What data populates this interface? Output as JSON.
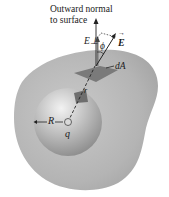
{
  "diagram": {
    "title_line1": "Outward normal",
    "title_line2": "to surface",
    "labels": {
      "e_perp": "E⊥",
      "phi": "ϕ",
      "e_vector": "E",
      "e_vector_arrow": "→",
      "dA": "dA",
      "r": "r",
      "R": "R",
      "q": "q"
    },
    "colors": {
      "outer_surface": "#b5b5b5",
      "inner_sphere_light": "#e6e6e6",
      "inner_sphere_dark": "#8e8e8e",
      "area_patch": "#7a7a7a",
      "line": "#222222",
      "background": "#ffffff"
    }
  }
}
